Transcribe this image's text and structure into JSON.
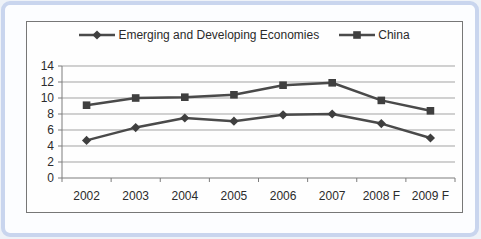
{
  "frame": {
    "border_color": "#c9d5ee",
    "card_background": "#fcfdff",
    "chart_box_border_color": "#777777"
  },
  "chart_data": {
    "type": "line",
    "title": "",
    "xlabel": "",
    "ylabel": "",
    "categories": [
      "2002",
      "2003",
      "2004",
      "2005",
      "2006",
      "2007",
      "2008 F",
      "2009 F"
    ],
    "series": [
      {
        "name": "Emerging and Developing Economies",
        "marker": "diamond",
        "values": [
          4.7,
          6.3,
          7.5,
          7.1,
          7.9,
          8.0,
          6.8,
          5.0
        ]
      },
      {
        "name": "China",
        "marker": "square",
        "values": [
          9.1,
          10.0,
          10.1,
          10.4,
          11.6,
          11.9,
          9.7,
          8.4
        ]
      }
    ],
    "ylim": [
      0,
      14
    ],
    "yticks": [
      0,
      2,
      4,
      6,
      8,
      10,
      12,
      14
    ],
    "grid": true,
    "legend_position": "top",
    "line_color": "#4a4a4a",
    "marker_color": "#3f3f3f",
    "gridline_color": "#a3a3a3",
    "axis_color": "#7d7d7d",
    "text_color": "#2b2b2b"
  }
}
